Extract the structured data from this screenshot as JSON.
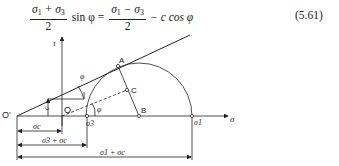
{
  "equation": {
    "lhs_numerator": [
      "σ",
      "1",
      " + σ",
      "3"
    ],
    "lhs_denominator": "2",
    "lhs_func": "sin φ =",
    "rhs_numerator": [
      "σ",
      "1",
      " − σ",
      "3"
    ],
    "rhs_denominator": "2",
    "rhs_tail": "− c cos φ",
    "number": "(5.61)"
  },
  "diagram": {
    "axis_labels": {
      "tau": "τ",
      "sigma": "σ"
    },
    "points": {
      "origin_shifted": "O'",
      "origin": "O",
      "tangent_point": "A",
      "midpoint": "C",
      "center": "B",
      "sigma3": "σ3",
      "sigma1": "σ1"
    },
    "angle_label": "φ",
    "cohesion_label": "c",
    "dimensions": {
      "sigma_c": "σc",
      "sigma3_plus_sigma_c": "σ3 + σc",
      "sigma1_plus_sigma_c": "σ1 + σc"
    }
  }
}
